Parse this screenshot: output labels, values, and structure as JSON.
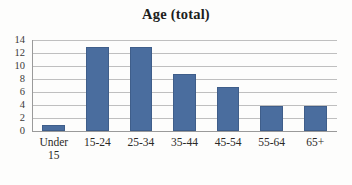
{
  "chart_data": {
    "type": "bar",
    "title": "Age (total)",
    "xlabel": "",
    "ylabel": "",
    "categories": [
      "Under 15",
      "15-24",
      "25-34",
      "35-44",
      "45-54",
      "55-64",
      "65+"
    ],
    "values": [
      1,
      12.9,
      12.9,
      8.8,
      6.8,
      3.8,
      3.8
    ],
    "ylim": [
      0,
      14
    ],
    "ytick_values": [
      0,
      2,
      4,
      6,
      8,
      10,
      12,
      14
    ],
    "ytick_labels": [
      "0",
      "2",
      "4",
      "6",
      "8",
      "10",
      "12",
      "14"
    ],
    "grid": true,
    "legend": false,
    "series": [
      {
        "name": "Age (total)",
        "values": [
          1,
          12.9,
          12.9,
          8.8,
          6.8,
          3.8,
          3.8
        ]
      }
    ]
  },
  "style": {
    "bar_color": "#4a6d9e",
    "bar_border_color": "#3f5e8a",
    "gridline_color": "#bfbfbf",
    "axis_color": "#9a9a9a",
    "background_color": "#fdfdfc",
    "title_color": "#201d1c",
    "tick_label_color": "#2b2927"
  }
}
